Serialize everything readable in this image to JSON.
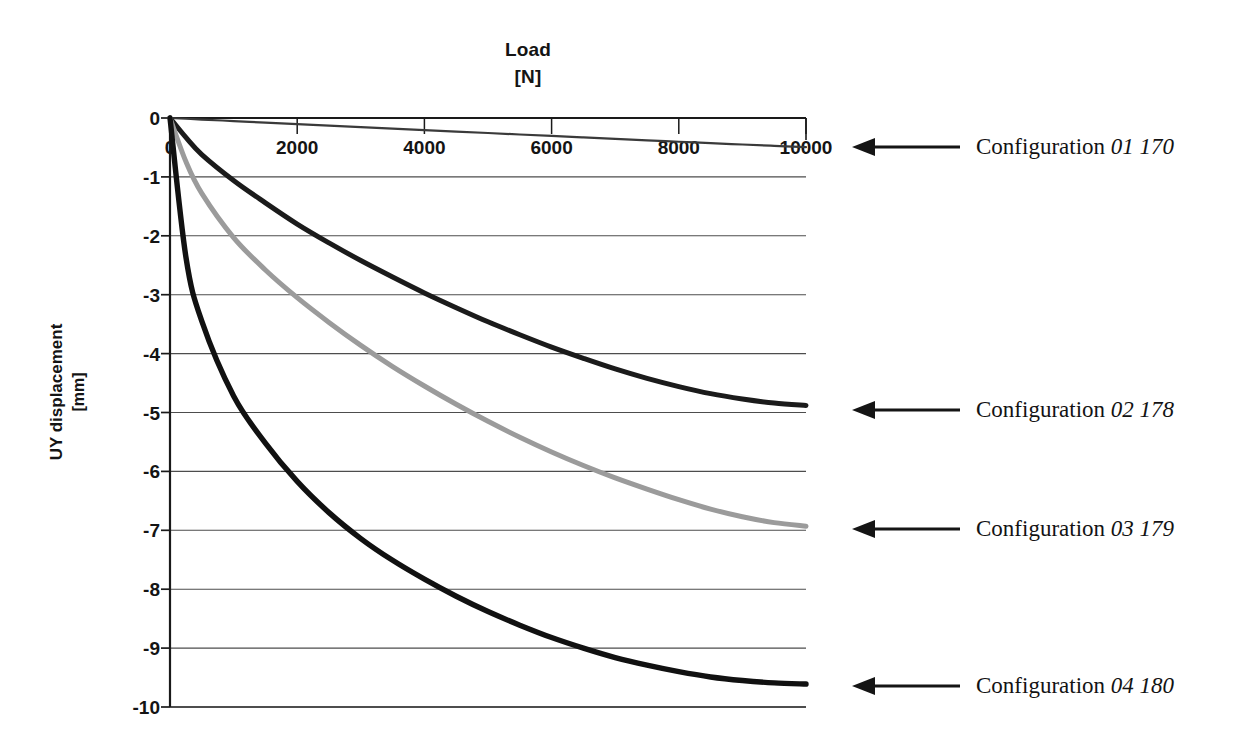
{
  "chart_data": {
    "type": "line",
    "title": "Load",
    "title_unit": "[N]",
    "xlabel": "Load [N]",
    "ylabel": "UY displacement",
    "ylabel_unit": "[mm]",
    "xlim": [
      0,
      10000
    ],
    "ylim": [
      -10,
      0
    ],
    "xticks": [
      0,
      2000,
      4000,
      6000,
      8000,
      10000
    ],
    "xtick_labels": [
      "0",
      "2000",
      "4000",
      "6000",
      "8000",
      "10000"
    ],
    "yticks": [
      0,
      -1,
      -2,
      -3,
      -4,
      -5,
      -6,
      -7,
      -8,
      -9,
      -10
    ],
    "ytick_labels": [
      "0",
      "-1",
      "-2",
      "-3",
      "-4",
      "-5",
      "-6",
      "-7",
      "-8",
      "-9",
      "-10"
    ],
    "grid": "horizontal",
    "legend_position": "right-callouts",
    "x": [
      0,
      250,
      500,
      1000,
      1500,
      2000,
      2500,
      3000,
      3500,
      4000,
      4500,
      5000,
      5500,
      6000,
      6500,
      7000,
      7500,
      8000,
      8500,
      9000,
      9500,
      10000
    ],
    "series": [
      {
        "name": "Configuration 01 170",
        "label_prefix": "Configuration",
        "label_code": "01 170",
        "color": "#3a3a3a",
        "width": 2.2,
        "values": [
          0,
          -0.013,
          -0.026,
          -0.052,
          -0.078,
          -0.104,
          -0.13,
          -0.155,
          -0.18,
          -0.205,
          -0.23,
          -0.255,
          -0.28,
          -0.305,
          -0.33,
          -0.355,
          -0.38,
          -0.403,
          -0.427,
          -0.45,
          -0.473,
          -0.496
        ]
      },
      {
        "name": "Configuration 02 178",
        "label_prefix": "Configuration",
        "label_code": "02 178",
        "color": "#1b1b1b",
        "width": 5.0,
        "values": [
          0,
          -0.33,
          -0.62,
          -1.06,
          -1.44,
          -1.8,
          -2.12,
          -2.42,
          -2.7,
          -2.97,
          -3.22,
          -3.46,
          -3.68,
          -3.89,
          -4.08,
          -4.26,
          -4.42,
          -4.56,
          -4.68,
          -4.77,
          -4.84,
          -4.88
        ]
      },
      {
        "name": "Configuration 03 179",
        "label_prefix": "Configuration",
        "label_code": "03 179",
        "color": "#9b9b9b",
        "width": 5.0,
        "values": [
          0,
          -0.74,
          -1.28,
          -2.03,
          -2.58,
          -3.05,
          -3.47,
          -3.86,
          -4.22,
          -4.55,
          -4.86,
          -5.15,
          -5.42,
          -5.67,
          -5.9,
          -6.11,
          -6.3,
          -6.48,
          -6.64,
          -6.77,
          -6.87,
          -6.93
        ]
      },
      {
        "name": "Configuration 04 180",
        "label_prefix": "Configuration",
        "label_code": "04 180",
        "color": "#111111",
        "width": 5.4,
        "values": [
          0,
          -2.36,
          -3.45,
          -4.72,
          -5.52,
          -6.17,
          -6.7,
          -7.14,
          -7.51,
          -7.83,
          -8.12,
          -8.38,
          -8.61,
          -8.82,
          -9.0,
          -9.16,
          -9.29,
          -9.4,
          -9.49,
          -9.55,
          -9.59,
          -9.61
        ]
      }
    ],
    "callouts": [
      {
        "series": "Configuration 01 170",
        "prefix": "Configuration",
        "code": "01 170",
        "y_value": -0.5
      },
      {
        "series": "Configuration 02 178",
        "prefix": "Configuration",
        "code": "02 178",
        "y_value": -4.95
      },
      {
        "series": "Configuration 03 179",
        "prefix": "Configuration",
        "code": "03 179",
        "y_value": -6.98
      },
      {
        "series": "Configuration 04 180",
        "prefix": "Configuration",
        "code": "04 180",
        "y_value": -9.65
      }
    ],
    "colors": {
      "axis": "#1a1a1a",
      "grid": "#4d4d4d",
      "background": "#ffffff",
      "text": "#141414"
    }
  }
}
